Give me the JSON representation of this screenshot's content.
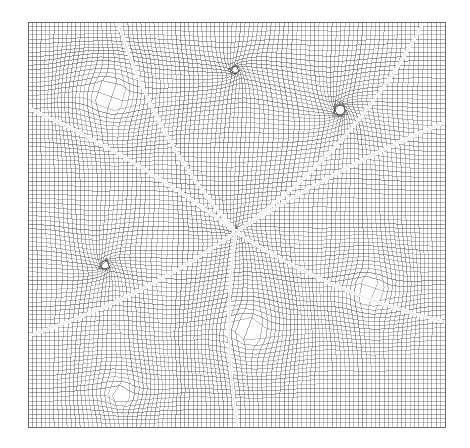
{
  "figure": {
    "kind": "structured-computational-mesh",
    "title": "",
    "caption": "",
    "background_color": "#ffffff",
    "line_color": "#4a4a4a",
    "gap_color": "#ffffff",
    "frame_color": "#5a5a5a"
  },
  "canvas": {
    "width": 470,
    "height": 448
  },
  "domain": {
    "x0": 28,
    "y0": 22,
    "x1": 445,
    "y1": 427,
    "label": "mesh-domain"
  },
  "mesh": {
    "nx": 96,
    "ny": 94,
    "cell_size_px": 4.4,
    "line_width": 0.55,
    "description": "dense structured quadrilateral grid"
  },
  "center": {
    "x": 236,
    "y": 232,
    "label": "multiblock-convergence-point"
  },
  "chart_data": {
    "type": "mesh",
    "title": "",
    "xlabel": "",
    "ylabel": "",
    "xlim": [
      28,
      445
    ],
    "ylim": [
      22,
      427
    ],
    "grid": true,
    "legend": "none",
    "center_point": [
      236,
      232
    ],
    "block_interfaces": [
      {
        "name": "spoke-west",
        "end_x": 28,
        "end_y": 108,
        "curve_bow": 14
      },
      {
        "name": "spoke-northnorthwest",
        "end_x": 118,
        "end_y": 22,
        "curve_bow": -26
      },
      {
        "name": "spoke-northeast",
        "end_x": 424,
        "end_y": 22,
        "curve_bow": 34
      },
      {
        "name": "spoke-east",
        "end_x": 445,
        "end_y": 122,
        "curve_bow": -10
      },
      {
        "name": "spoke-southeast",
        "end_x": 445,
        "end_y": 322,
        "curve_bow": 20
      },
      {
        "name": "spoke-southsouthwest",
        "end_x": 238,
        "end_y": 427,
        "curve_bow": 16
      },
      {
        "name": "spoke-southwest",
        "end_x": 28,
        "end_y": 336,
        "curve_bow": -18
      }
    ],
    "gap_width_px": 3.4,
    "distortion_sources": [
      {
        "name": "warp-upper-left",
        "x": 110,
        "y": 95,
        "radius": 95,
        "strength": 10
      },
      {
        "name": "warp-upper-right",
        "x": 340,
        "y": 110,
        "radius": 105,
        "strength": -11
      },
      {
        "name": "warp-left",
        "x": 105,
        "y": 265,
        "radius": 95,
        "strength": -9
      },
      {
        "name": "warp-lower-middle",
        "x": 250,
        "y": 330,
        "radius": 90,
        "strength": 9
      },
      {
        "name": "warp-right",
        "x": 370,
        "y": 290,
        "radius": 85,
        "strength": 8
      },
      {
        "name": "warp-center",
        "x": 236,
        "y": 232,
        "radius": 120,
        "strength": -7
      },
      {
        "name": "warp-bottom-left",
        "x": 120,
        "y": 395,
        "radius": 80,
        "strength": 7
      },
      {
        "name": "warp-top-middle",
        "x": 235,
        "y": 70,
        "radius": 95,
        "strength": -8
      }
    ]
  },
  "accessibility": {
    "alt_text": "Dense structured quadrilateral computational mesh filling a square domain, with several light block-interface lines radiating from a central point out to the domain boundary."
  }
}
